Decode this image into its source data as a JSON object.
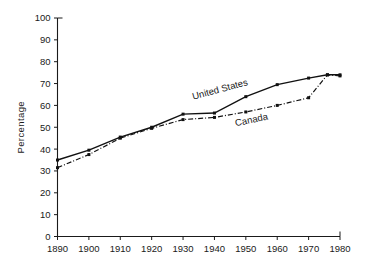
{
  "chart_data": {
    "type": "line",
    "title": "",
    "subtitle": "",
    "xlabel": "",
    "ylabel": "Percentage",
    "xlim": [
      1890,
      1980
    ],
    "ylim": [
      0,
      100
    ],
    "grid": false,
    "legend_position": "inline-annotation",
    "x_ticks": [
      1890,
      1900,
      1910,
      1920,
      1930,
      1940,
      1950,
      1960,
      1970,
      1980
    ],
    "y_ticks": [
      0,
      10,
      20,
      30,
      40,
      50,
      60,
      70,
      80,
      90,
      100
    ],
    "x_tick_labels": [
      "1890",
      "1900",
      "1910",
      "1920",
      "1930",
      "1940",
      "1950",
      "1960",
      "1970",
      "1980"
    ],
    "y_tick_labels": [
      "0",
      "10",
      "20",
      "30",
      "40",
      "50",
      "60",
      "70",
      "80",
      "90",
      "100"
    ],
    "series": [
      {
        "name": "United States",
        "style": "solid",
        "x": [
          1890,
          1900,
          1910,
          1920,
          1930,
          1940,
          1950,
          1960,
          1970,
          1976,
          1980
        ],
        "values": [
          35.0,
          39.5,
          45.5,
          50.0,
          56.0,
          56.5,
          64.0,
          69.5,
          72.5,
          74.0,
          74.0
        ]
      },
      {
        "name": "Canada",
        "style": "dash-dot",
        "x": [
          1890,
          1900,
          1910,
          1920,
          1930,
          1940,
          1950,
          1960,
          1970,
          1976,
          1980
        ],
        "values": [
          31.5,
          37.5,
          45.0,
          49.5,
          53.5,
          54.5,
          57.0,
          60.0,
          63.5,
          74.0,
          73.5
        ]
      }
    ],
    "annotations": [
      {
        "text": "United States",
        "x": 1942,
        "y": 66.0,
        "rotation": -15
      },
      {
        "text": "Canada",
        "x": 1952,
        "y": 52.0,
        "rotation": -12
      }
    ]
  }
}
